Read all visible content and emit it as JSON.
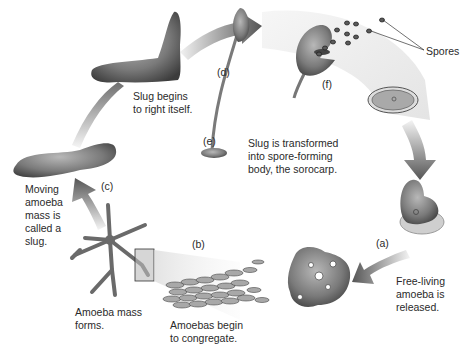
{
  "diagram": {
    "type": "life-cycle",
    "colors": {
      "cell_dark": "#4a4a4a",
      "cell_mid": "#8a8a8a",
      "cell_light": "#c4c4c4",
      "arrow_dark": "#505050",
      "arrow_light": "#e6e6e6",
      "background": "#ffffff"
    },
    "stages": [
      {
        "id": "a",
        "tag": "(a)",
        "caption": "Free-living\namoeba is\nreleased."
      },
      {
        "id": "b",
        "tag": "(b)",
        "caption": "Amoebas begin\nto congregate."
      },
      {
        "id": "b2",
        "tag": "",
        "caption": "Amoeba mass\nforms."
      },
      {
        "id": "c",
        "tag": "(c)",
        "caption": "Moving\namoeba\nmass is\ncalled a\nslug."
      },
      {
        "id": "d",
        "tag": "(d)",
        "caption": "Slug begins\nto right itself."
      },
      {
        "id": "e",
        "tag": "(e)",
        "caption": "Slug is transformed\ninto spore-forming\nbody, the sorocarp."
      },
      {
        "id": "f",
        "tag": "(f)",
        "caption": ""
      }
    ],
    "callouts": [
      {
        "label": "Spores"
      }
    ]
  }
}
